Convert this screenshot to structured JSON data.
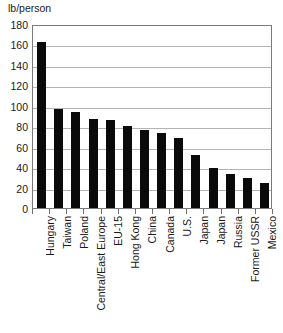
{
  "chart_data": {
    "type": "bar",
    "title": "",
    "subtitle": "",
    "xlabel": "",
    "ylabel": "lb/person",
    "ylim": [
      0,
      180
    ],
    "ytick_step": 20,
    "yticks": [
      180,
      160,
      140,
      120,
      100,
      80,
      60,
      40,
      20,
      0
    ],
    "grid": true,
    "legend": false,
    "bar_color": "#0a0a0a",
    "plot_background": "#ffffff",
    "gridline_color": "#b4b4b4",
    "frame_color": "#7a7a7a",
    "categories": [
      "Hungary",
      "Taiwan",
      "Poland",
      "Central/East Europe",
      "EU-15",
      "Hong Kong",
      "China",
      "Canada",
      "U.S.",
      "Japan",
      "Japan",
      "Russia",
      "Former USSR",
      "Mexico"
    ],
    "values": [
      162,
      97,
      94,
      87,
      86,
      80,
      76,
      73,
      68,
      52,
      39,
      33,
      29,
      24
    ]
  }
}
